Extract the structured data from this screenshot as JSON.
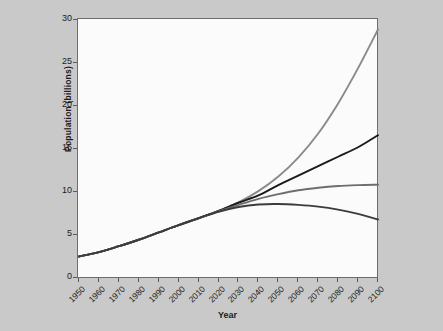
{
  "chart_data": {
    "type": "line",
    "title": "",
    "xlabel": "Year",
    "ylabel": "Population (billions)",
    "xlim": [
      1950,
      2100
    ],
    "ylim": [
      0,
      30
    ],
    "xticks": [
      1950,
      1960,
      1970,
      1980,
      1990,
      2000,
      2010,
      2020,
      2030,
      2040,
      2050,
      2060,
      2070,
      2080,
      2090,
      2100
    ],
    "yticks": [
      0,
      5,
      10,
      15,
      20,
      25,
      30
    ],
    "grid": false,
    "legend": "none",
    "x": [
      1950,
      1960,
      1970,
      1980,
      1990,
      2000,
      2010,
      2020,
      2030,
      2040,
      2050,
      2060,
      2070,
      2080,
      2090,
      2100
    ],
    "series": [
      {
        "name": "constant-fertility",
        "color": "#8a8a8a",
        "values": [
          2.5,
          3.0,
          3.7,
          4.45,
          5.3,
          6.15,
          6.95,
          7.8,
          8.8,
          10.1,
          11.8,
          14.0,
          16.8,
          20.3,
          24.4,
          28.9
        ]
      },
      {
        "name": "high-variant",
        "color": "#1a1a1a",
        "values": [
          2.5,
          3.0,
          3.7,
          4.45,
          5.3,
          6.15,
          6.95,
          7.8,
          8.75,
          9.6,
          10.8,
          11.9,
          13.0,
          14.1,
          15.2,
          16.6
        ]
      },
      {
        "name": "medium-variant",
        "color": "#6e6e6e",
        "values": [
          2.5,
          3.0,
          3.7,
          4.45,
          5.3,
          6.15,
          6.95,
          7.75,
          8.5,
          9.2,
          9.75,
          10.2,
          10.5,
          10.7,
          10.8,
          10.85
        ]
      },
      {
        "name": "low-variant",
        "color": "#3c3c3c",
        "values": [
          2.5,
          3.0,
          3.7,
          4.45,
          5.3,
          6.15,
          6.95,
          7.7,
          8.25,
          8.55,
          8.6,
          8.5,
          8.3,
          7.95,
          7.45,
          6.8
        ]
      }
    ]
  },
  "axes": {
    "y_label": "Population (billions)",
    "x_label": "Year",
    "y_tick_labels": [
      "0",
      "5",
      "10",
      "15",
      "20",
      "25",
      "30"
    ],
    "x_tick_labels": [
      "1950",
      "1960",
      "1970",
      "1980",
      "1990",
      "2000",
      "2010",
      "2020",
      "2030",
      "2040",
      "2050",
      "2060",
      "2070",
      "2080",
      "2090",
      "2100"
    ]
  },
  "style": {
    "background": "#c9c9c9",
    "plot_background": "#fbfbfb",
    "axis_color": "#6e6e6e",
    "text_color": "#1c1c1c"
  }
}
